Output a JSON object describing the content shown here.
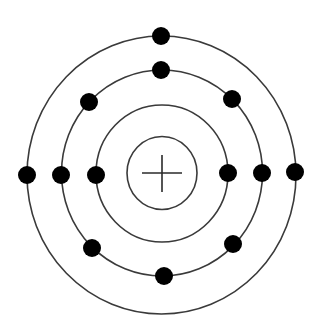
{
  "diagram": {
    "title": "",
    "type": "bohr-atom-model",
    "nucleus": {
      "symbol": "+",
      "cx": 162,
      "cy": 173,
      "rx": 35,
      "ry": 36.5
    },
    "shells": [
      {
        "name": "shell-1",
        "cx": 162,
        "cy": 173.5,
        "rx": 66,
        "ry": 68.5,
        "electron_count": 2
      },
      {
        "name": "shell-2",
        "cx": 162,
        "cy": 173,
        "rx": 100.5,
        "ry": 103,
        "electron_count": 8
      },
      {
        "name": "shell-3",
        "cx": 161.5,
        "cy": 175,
        "rx": 134.5,
        "ry": 139,
        "electron_count": 3
      }
    ],
    "electrons": [
      {
        "shell": 1,
        "cx": 96,
        "cy": 175
      },
      {
        "shell": 1,
        "cx": 228,
        "cy": 173
      },
      {
        "shell": 2,
        "cx": 161,
        "cy": 70
      },
      {
        "shell": 2,
        "cx": 232,
        "cy": 99
      },
      {
        "shell": 2,
        "cx": 262,
        "cy": 173
      },
      {
        "shell": 2,
        "cx": 233,
        "cy": 244
      },
      {
        "shell": 2,
        "cx": 164,
        "cy": 276
      },
      {
        "shell": 2,
        "cx": 92,
        "cy": 248
      },
      {
        "shell": 2,
        "cx": 61,
        "cy": 175
      },
      {
        "shell": 2,
        "cx": 89,
        "cy": 102
      },
      {
        "shell": 3,
        "cx": 161,
        "cy": 36
      },
      {
        "shell": 3,
        "cx": 295,
        "cy": 172
      },
      {
        "shell": 3,
        "cx": 27,
        "cy": 175
      }
    ],
    "electron_radius": 9,
    "total_electrons": 13,
    "colors": {
      "line": "#3a3a3a",
      "electron": "#000000",
      "background": "#ffffff"
    }
  }
}
